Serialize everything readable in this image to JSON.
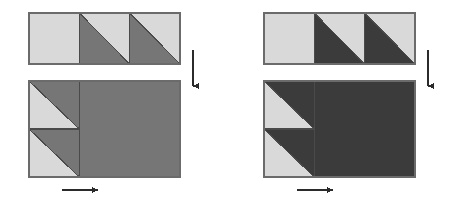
{
  "figure": {
    "panel_count": 2,
    "background_color": "#ffffff",
    "outline_color": "#6b6b6b",
    "divider_color": "#4a4a4a",
    "arrow_color": "#2b2b2b"
  },
  "panels": [
    {
      "id": "left-panel",
      "name": "left-diagram",
      "label": "",
      "light_color": "#d9d9d9",
      "dark_color": "#767676",
      "origin": {
        "x": 29,
        "y": 13
      },
      "top_strip": {
        "name": "top-strip",
        "x": 29,
        "y": 13,
        "width": 151,
        "height": 51,
        "cell_count": 3,
        "cell_width": 50.3,
        "cells": [
          {
            "index": 0,
            "pattern": "solid-light",
            "diagonal": "none"
          },
          {
            "index": 1,
            "pattern": "split-diagonal",
            "diagonal": "tl-br",
            "dark_side": "below-left",
            "light_side": "above-right"
          },
          {
            "index": 2,
            "pattern": "split-diagonal",
            "diagonal": "tl-br",
            "dark_side": "below-left",
            "light_side": "above-right"
          }
        ]
      },
      "bottom_rect": {
        "name": "bottom-rectangle",
        "x": 29,
        "y": 81,
        "width": 151,
        "height": 96,
        "left_column": {
          "name": "left-column",
          "width": 50.3,
          "cells": [
            {
              "index": 0,
              "pattern": "split-diagonal",
              "diagonal": "tl-br",
              "dark_side": "above-right",
              "light_side": "below-left"
            },
            {
              "index": 1,
              "pattern": "split-diagonal",
              "diagonal": "tl-br",
              "dark_side": "above-right",
              "light_side": "below-left"
            }
          ]
        },
        "right_region": {
          "name": "solid-dark-region",
          "pattern": "solid-dark",
          "width": 100.7
        }
      },
      "arrow_down": {
        "name": "down-arrow",
        "x": 193,
        "y1": 50,
        "y2": 86,
        "direction": "down"
      },
      "arrow_right": {
        "name": "right-arrow",
        "y": 190,
        "x1": 62,
        "x2": 98,
        "direction": "right"
      }
    },
    {
      "id": "right-panel",
      "name": "right-diagram",
      "label": "",
      "light_color": "#d9d9d9",
      "dark_color": "#3b3b3b",
      "origin": {
        "x": 264,
        "y": 13
      },
      "top_strip": {
        "name": "top-strip",
        "x": 264,
        "y": 13,
        "width": 151,
        "height": 51,
        "cell_count": 3,
        "cell_width": 50.3,
        "cells": [
          {
            "index": 0,
            "pattern": "solid-light",
            "diagonal": "none"
          },
          {
            "index": 1,
            "pattern": "split-diagonal",
            "diagonal": "tl-br",
            "dark_side": "below-left",
            "light_side": "above-right"
          },
          {
            "index": 2,
            "pattern": "split-diagonal",
            "diagonal": "tl-br",
            "dark_side": "below-left",
            "light_side": "above-right"
          }
        ]
      },
      "bottom_rect": {
        "name": "bottom-rectangle",
        "x": 264,
        "y": 81,
        "width": 151,
        "height": 96,
        "left_column": {
          "name": "left-column",
          "width": 50.3,
          "cells": [
            {
              "index": 0,
              "pattern": "split-diagonal",
              "diagonal": "tl-br",
              "dark_side": "above-right",
              "light_side": "below-left"
            },
            {
              "index": 1,
              "pattern": "split-diagonal",
              "diagonal": "tl-br",
              "dark_side": "above-right",
              "light_side": "below-left"
            }
          ]
        },
        "right_region": {
          "name": "solid-dark-region",
          "pattern": "solid-dark",
          "width": 100.7
        }
      },
      "arrow_down": {
        "name": "down-arrow",
        "x": 428,
        "y1": 50,
        "y2": 86,
        "direction": "down"
      },
      "arrow_right": {
        "name": "right-arrow",
        "y": 190,
        "x1": 297,
        "x2": 333,
        "direction": "right"
      }
    }
  ]
}
